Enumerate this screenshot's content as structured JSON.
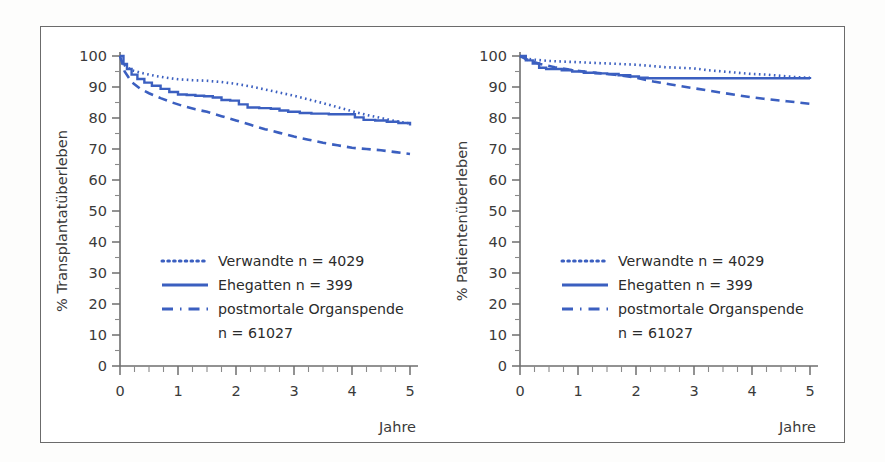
{
  "figure": {
    "background_color": "#ffffff",
    "frame_color": "#6b6b6b",
    "series_color": "#3b5fc0",
    "axis_color": "#6e6e6e"
  },
  "chart_data": [
    {
      "id": "transplant-survival",
      "type": "line",
      "title": "",
      "xlabel": "Jahre",
      "ylabel": "% Transplantatüberleben",
      "xlim": [
        0,
        5
      ],
      "ylim": [
        0,
        100
      ],
      "grid": false,
      "legend_position": "center-left",
      "xticks": [
        0,
        1,
        2,
        3,
        4,
        5
      ],
      "xtick_labels": [
        "0",
        "1",
        "2",
        "3",
        "4",
        "5"
      ],
      "xminor_step": 0.25,
      "yticks": [
        0,
        10,
        20,
        30,
        40,
        50,
        60,
        70,
        80,
        90,
        100
      ],
      "ytick_labels": [
        "0",
        "10",
        "20",
        "30",
        "40",
        "50",
        "60",
        "70",
        "80",
        "90",
        "100"
      ],
      "yminor_step": 5,
      "series": [
        {
          "name": "Verwandte",
          "n": 4029,
          "legend_label": "Verwandte  n = 4029",
          "style": "dotted",
          "color": "#3b5fc0",
          "x": [
            0,
            0.08,
            0.2,
            0.4,
            0.6,
            0.8,
            1.0,
            1.25,
            1.5,
            1.75,
            2.0,
            2.25,
            2.5,
            2.75,
            3.0,
            3.25,
            3.5,
            3.75,
            4.0,
            4.25,
            4.5,
            4.75,
            5.0
          ],
          "y": [
            100,
            97.0,
            95.4,
            94.4,
            93.6,
            93.0,
            92.5,
            92.2,
            92.0,
            91.6,
            91.0,
            90.2,
            89.2,
            88.2,
            87.2,
            86.0,
            84.8,
            83.5,
            82.2,
            81.0,
            80.0,
            79.0,
            78.2
          ]
        },
        {
          "name": "Ehegatten",
          "n": 399,
          "legend_label": "Ehegatten  n =     399",
          "style": "solid",
          "color": "#3b5fc0",
          "x": [
            0,
            0.06,
            0.12,
            0.2,
            0.3,
            0.42,
            0.55,
            0.7,
            0.85,
            1.0,
            1.15,
            1.3,
            1.45,
            1.6,
            1.75,
            1.9,
            2.05,
            2.2,
            2.4,
            2.6,
            2.75,
            2.9,
            3.1,
            3.3,
            3.6,
            3.9,
            4.05,
            4.2,
            4.4,
            4.6,
            4.8,
            5.0
          ],
          "y": [
            100,
            97.4,
            95.8,
            94.0,
            92.6,
            91.4,
            90.4,
            89.4,
            88.4,
            87.6,
            87.4,
            87.2,
            87.0,
            86.6,
            85.8,
            85.6,
            84.4,
            83.4,
            83.2,
            83.0,
            82.4,
            82.0,
            81.6,
            81.4,
            81.2,
            81.2,
            80.2,
            79.4,
            79.2,
            78.8,
            78.4,
            77.6
          ]
        },
        {
          "name": "postmortale Organspende",
          "n": 61027,
          "legend_label": "postmortale Organspende",
          "legend_label2": "n = 61027",
          "style": "dashed",
          "color": "#3b5fc0",
          "x": [
            0,
            0.08,
            0.2,
            0.35,
            0.5,
            0.7,
            0.9,
            1.1,
            1.3,
            1.5,
            1.75,
            2.0,
            2.25,
            2.5,
            2.75,
            3.0,
            3.25,
            3.5,
            3.75,
            4.0,
            4.25,
            4.5,
            4.75,
            5.0
          ],
          "y": [
            100,
            95.0,
            91.6,
            89.4,
            88.0,
            86.4,
            85.0,
            83.8,
            82.8,
            82.0,
            80.6,
            79.2,
            77.8,
            76.4,
            75.2,
            74.0,
            73.0,
            72.0,
            71.2,
            70.4,
            70.0,
            69.6,
            69.0,
            68.4
          ]
        }
      ]
    },
    {
      "id": "patient-survival",
      "type": "line",
      "title": "",
      "xlabel": "Jahre",
      "ylabel": "% Patientenüberleben",
      "xlim": [
        0,
        5
      ],
      "ylim": [
        0,
        100
      ],
      "grid": false,
      "legend_position": "center-left",
      "xticks": [
        0,
        1,
        2,
        3,
        4,
        5
      ],
      "xtick_labels": [
        "0",
        "1",
        "2",
        "3",
        "4",
        "5"
      ],
      "xminor_step": 0.25,
      "yticks": [
        0,
        10,
        20,
        30,
        40,
        50,
        60,
        70,
        80,
        90,
        100
      ],
      "ytick_labels": [
        "0",
        "10",
        "20",
        "30",
        "40",
        "50",
        "60",
        "70",
        "80",
        "90",
        "100"
      ],
      "yminor_step": 5,
      "series": [
        {
          "name": "Verwandte",
          "n": 4029,
          "legend_label": "Verwandte  n = 4029",
          "style": "dotted",
          "color": "#3b5fc0",
          "x": [
            0,
            0.1,
            0.25,
            0.5,
            0.75,
            1.0,
            1.25,
            1.5,
            1.75,
            2.0,
            2.25,
            2.5,
            2.75,
            3.0,
            3.25,
            3.5,
            3.75,
            4.0,
            4.25,
            4.5,
            4.75,
            5.0
          ],
          "y": [
            100,
            99.2,
            98.8,
            98.4,
            98.2,
            98.0,
            97.8,
            97.6,
            97.4,
            97.2,
            96.8,
            96.4,
            96.2,
            96.0,
            95.4,
            95.0,
            94.6,
            94.2,
            94.0,
            93.6,
            93.2,
            93.0
          ]
        },
        {
          "name": "Ehegatten",
          "n": 399,
          "legend_label": "Ehegatten  n =     399",
          "style": "solid",
          "color": "#3b5fc0",
          "x": [
            0,
            0.1,
            0.22,
            0.33,
            0.45,
            0.6,
            0.72,
            0.9,
            1.1,
            1.3,
            1.5,
            1.7,
            1.9,
            2.05,
            2.2,
            2.5,
            3.0,
            3.5,
            4.0,
            4.5,
            5.0
          ],
          "y": [
            100,
            98.6,
            97.6,
            96.2,
            95.8,
            95.8,
            95.4,
            95.0,
            94.6,
            94.4,
            94.2,
            93.8,
            93.4,
            93.0,
            92.8,
            92.8,
            92.8,
            92.8,
            92.8,
            92.8,
            92.6
          ]
        },
        {
          "name": "postmortale Organspende",
          "n": 61027,
          "legend_label": "postmortale Organspende",
          "legend_label2": "n = 61027",
          "style": "dashed",
          "color": "#3b5fc0",
          "x": [
            0,
            0.15,
            0.35,
            0.6,
            0.85,
            1.1,
            1.4,
            1.7,
            2.0,
            2.3,
            2.6,
            3.0,
            3.4,
            3.8,
            4.2,
            4.6,
            5.0
          ],
          "y": [
            100,
            98.6,
            97.4,
            96.4,
            95.6,
            95.0,
            94.4,
            93.8,
            93.0,
            91.8,
            90.8,
            89.6,
            88.4,
            87.2,
            86.2,
            85.4,
            84.6
          ]
        }
      ]
    }
  ]
}
